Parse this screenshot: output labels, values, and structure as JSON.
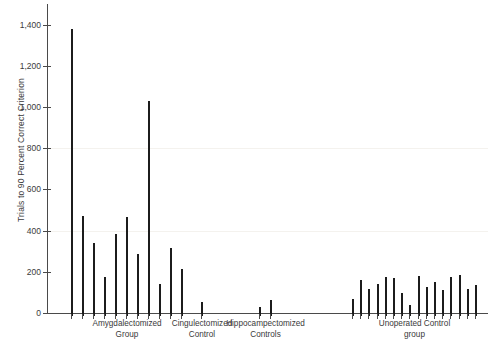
{
  "chart_data": {
    "type": "bar",
    "title": "",
    "xlabel": "",
    "ylabel": "Trials to 90 Percent Correct Criterion",
    "ylim": [
      0,
      1500
    ],
    "ytick_values": [
      0,
      200,
      400,
      600,
      800,
      1000,
      1200,
      1400
    ],
    "ytick_labels": [
      "0",
      "200",
      "400",
      "600",
      "800",
      "1,000",
      "1,200",
      "1,400"
    ],
    "grid": false,
    "legend": "none",
    "bar_color": "#1c1c1c",
    "axis_color": "#4a4a4a",
    "groups": [
      {
        "name": "amygdalectomized",
        "label_line1": "Amygdalectomized",
        "label_line2": "Group",
        "values": [
          1395,
          485,
          355,
          190,
          400,
          480,
          300,
          1045,
          155,
          330,
          230
        ]
      },
      {
        "name": "cingulectomized",
        "label_line1": "Cingulectomized",
        "label_line2": "Control",
        "values": [
          70
        ]
      },
      {
        "name": "hippocampectomized",
        "label_line1": "Hippocampectomized",
        "label_line2": "Controls",
        "values": [
          45,
          80
        ]
      },
      {
        "name": "unoperated",
        "label_line1": "Unoperated Control",
        "label_line2": "group",
        "values": [
          85,
          175,
          130,
          155,
          190,
          185,
          110,
          55,
          195,
          140,
          165,
          125,
          190,
          200,
          130,
          150
        ]
      }
    ]
  }
}
